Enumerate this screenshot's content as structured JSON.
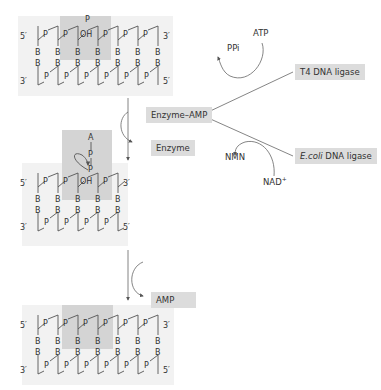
{
  "strands": {
    "end_5": "5′",
    "end_3": "3′",
    "phosphate": "P",
    "base": "B",
    "hydroxyl": "OH",
    "adenosine": "A"
  },
  "steps": [
    {
      "name": "nicked-dna",
      "description": "Nicked double-stranded DNA with 5′-phosphate and 3′-OH"
    },
    {
      "name": "adenylated-dna",
      "description": "AMP transferred to 5′-phosphate at nick"
    },
    {
      "name": "sealed-dna",
      "description": "Phosphodiester bond formed, nick sealed"
    }
  ],
  "labels": {
    "enzyme_amp": "Enzyme–AMP",
    "enzyme": "Enzyme",
    "amp": "AMP",
    "atp": "ATP",
    "ppi": "PPi",
    "t4_ligase": "T4 DNA ligase",
    "ecoli_italic": "E.coli",
    "ecoli_rest": " DNA ligase",
    "nmn": "NMN",
    "nad": "NAD",
    "nad_sup": "+"
  },
  "colors": {
    "panel": "#f2f2f2",
    "highlight": "#d4d4d4",
    "box": "#dcdcdc",
    "line": "#555555"
  }
}
